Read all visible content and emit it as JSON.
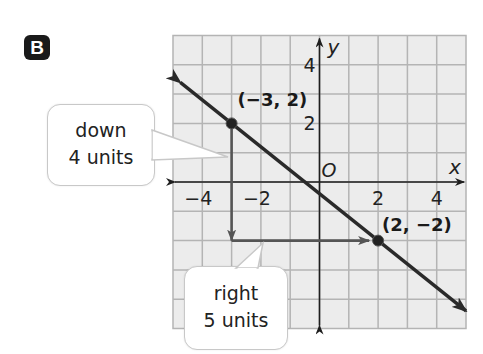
{
  "label": "B",
  "chart_data": {
    "type": "line",
    "title": "",
    "xlabel": "x",
    "ylabel": "y",
    "origin_label": "O",
    "xlim": [
      -5,
      5
    ],
    "ylim": [
      -5,
      5
    ],
    "grid": true,
    "x_ticks": [
      {
        "value": -4,
        "label": "−4"
      },
      {
        "value": -2,
        "label": "−2"
      },
      {
        "value": 2,
        "label": "2"
      },
      {
        "value": 4,
        "label": "4"
      }
    ],
    "y_ticks": [
      {
        "value": 4,
        "label": "4"
      },
      {
        "value": 2,
        "label": "2"
      }
    ],
    "line": {
      "through": [
        [
          -3,
          2
        ],
        [
          2,
          -2
        ]
      ],
      "slope": -0.8,
      "arrows_both_ends": true
    },
    "points": [
      {
        "x": -3,
        "y": 2,
        "label": "(−3, 2)"
      },
      {
        "x": 2,
        "y": -2,
        "label": "(2, −2)"
      }
    ],
    "movements": [
      {
        "from": [
          -3,
          2
        ],
        "to": [
          -3,
          -2
        ],
        "direction": "down",
        "units": 4
      },
      {
        "from": [
          -3,
          -2
        ],
        "to": [
          2,
          -2
        ],
        "direction": "right",
        "units": 5
      }
    ]
  },
  "callouts": {
    "down": {
      "line1": "down",
      "line2": "4 units"
    },
    "right": {
      "line1": "right",
      "line2": "5 units"
    }
  },
  "colors": {
    "grid_bg": "#ececec",
    "grid_line": "#b4b4b4",
    "axis": "#1e1e1e",
    "line": "#2a2a2a",
    "move_arrow": "#555555",
    "badge": "#1a1a1a"
  }
}
